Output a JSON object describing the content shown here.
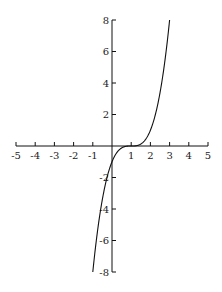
{
  "chart_data": {
    "type": "line",
    "title": "",
    "xlabel": "",
    "ylabel": "",
    "function": "y = (x - 1)^3",
    "xlim": [
      -5,
      5
    ],
    "ylim": [
      -8,
      8
    ],
    "grid": false,
    "legend": null,
    "x_ticks": [
      -5,
      -4,
      -3,
      -2,
      -1,
      1,
      2,
      3,
      4,
      5
    ],
    "x_tick_labels": [
      "-5",
      "-4",
      "-3",
      "-2",
      "-1",
      "1",
      "2",
      "3",
      "4",
      "5"
    ],
    "y_ticks": [
      -8,
      -6,
      -4,
      -2,
      2,
      4,
      6,
      8
    ],
    "y_tick_labels": [
      "-8",
      "-6",
      "-4",
      "-2",
      "2",
      "4",
      "6",
      "8"
    ],
    "series": [
      {
        "name": "(x-1)^3",
        "x": [
          -1,
          -0.5,
          0,
          0.5,
          1,
          1.5,
          2,
          2.5,
          3
        ],
        "y": [
          -8,
          -3.375,
          -1,
          -0.125,
          0,
          0.125,
          1,
          3.375,
          8
        ]
      }
    ],
    "color": "#111111"
  }
}
